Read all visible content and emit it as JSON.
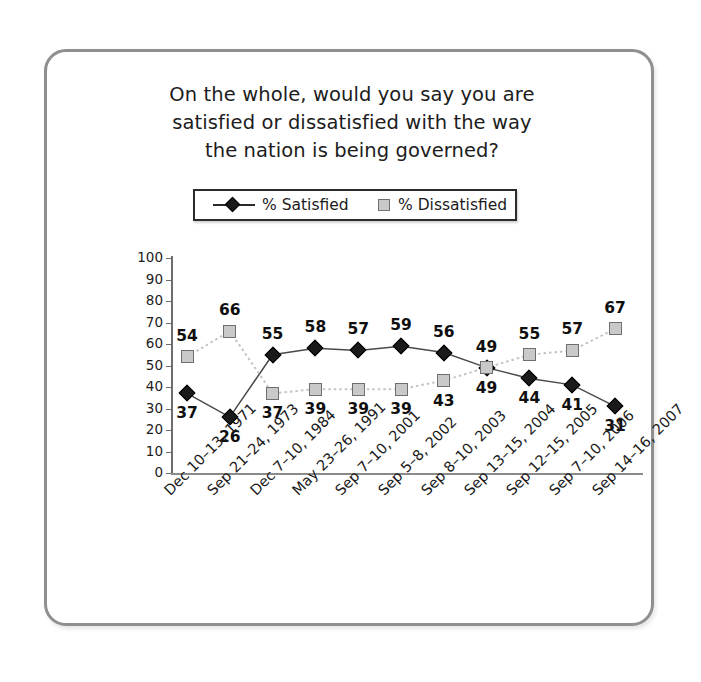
{
  "card": {
    "border_color": "#8e8f91"
  },
  "title": {
    "line1": "On the whole, would you say you are",
    "line2": "satisfied or dissatisfied with the way",
    "line3": "the nation is being governed?"
  },
  "legend": {
    "satisfied_label": "% Satisfied",
    "dissatisfied_label": "% Dissatisfied",
    "satisfied_marker": "diamond-marker-icon",
    "dissatisfied_marker": "square-marker-icon"
  },
  "chart_data": {
    "type": "line",
    "title": "On the whole, would you say you are satisfied or dissatisfied with the way the nation is being governed?",
    "xlabel": "",
    "ylabel": "",
    "ylim": [
      0,
      100
    ],
    "ytick_step": 10,
    "yticks": [
      100,
      90,
      80,
      70,
      60,
      50,
      40,
      30,
      20,
      10,
      0
    ],
    "grid": false,
    "legend_position": "above-plot",
    "categories": [
      "Dec 10–13, 1971",
      "Sep 21–24, 1973",
      "Dec 7–10, 1984",
      "May 23–26, 1991",
      "Sep 7–10, 2001",
      "Sep 5–8, 2002",
      "Sep 8–10, 2003",
      "Sep 13–15, 2004",
      "Sep 12–15, 2005",
      "Sep 7–10, 2006",
      "Sep 14–16, 2007"
    ],
    "series": [
      {
        "name": "% Satisfied",
        "color": "#1a1a1a",
        "marker": "diamond",
        "linestyle": "solid",
        "values": [
          37,
          26,
          55,
          58,
          57,
          59,
          56,
          49,
          44,
          41,
          31
        ],
        "label_positions": [
          "below",
          "below",
          "above",
          "above",
          "above",
          "above",
          "above",
          "below",
          "below",
          "below",
          "below"
        ]
      },
      {
        "name": "% Dissatisfied",
        "color": "#c9c9c9",
        "marker": "square",
        "linestyle": "dotted",
        "values": [
          54,
          66,
          37,
          39,
          39,
          39,
          43,
          49,
          55,
          57,
          67
        ],
        "label_positions": [
          "above",
          "above",
          "below",
          "below",
          "below",
          "below",
          "below",
          "above",
          "above",
          "above",
          "above"
        ]
      }
    ]
  }
}
